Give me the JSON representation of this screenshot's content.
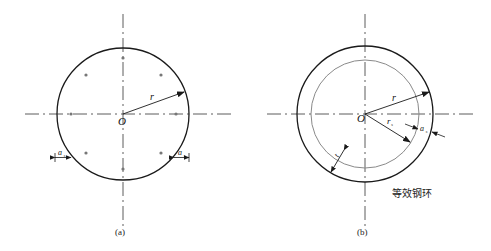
{
  "panels": [
    {
      "id": "a",
      "caption": "(a)",
      "center_label": "O",
      "radius_label": "r",
      "cover_label_main": "a",
      "cover_label_sub": "s",
      "center": [
        123,
        114
      ],
      "radius": 66,
      "bar_dots": 8
    },
    {
      "id": "b",
      "caption": "(b)",
      "center_label": "O",
      "radius_label": "r",
      "steel_radius_label_main": "r",
      "steel_radius_label_sub": "s",
      "cover_label_main": "a",
      "cover_label_sub": "s",
      "thickness_label": "t",
      "ring_label": "等效钢环",
      "center": [
        365,
        114
      ],
      "outer_radius": 68,
      "inner_radius": 54
    }
  ],
  "colors": {
    "outline": "#1a1a1a",
    "inner_ring": "#8a8a8a",
    "axis": "#333333",
    "dot": "#777777"
  }
}
